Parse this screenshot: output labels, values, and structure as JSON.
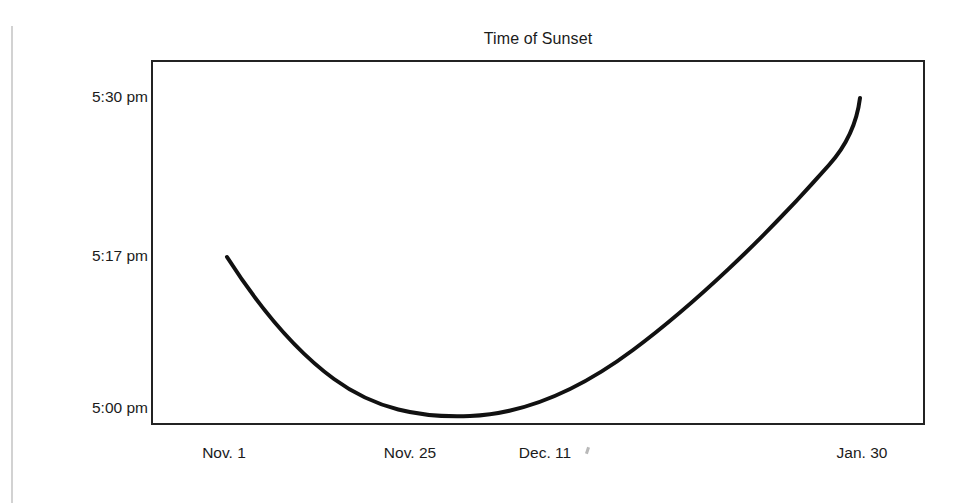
{
  "chart_data": {
    "type": "line",
    "title": "Time of Sunset",
    "xlabel": "",
    "ylabel": "",
    "grid": false,
    "legend": null,
    "x_tick_labels": [
      "Nov. 1",
      "Nov. 25",
      "Dec. 11",
      "Jan. 30"
    ],
    "y_tick_labels": [
      "5:30 pm",
      "5:17 pm",
      "5:00 pm"
    ],
    "ylim": [
      "5:00 pm",
      "5:35 pm"
    ],
    "x_tick_positions_px": [
      224,
      410,
      545,
      862
    ],
    "y_tick_positions_px": [
      97,
      256,
      408
    ],
    "series": [
      {
        "name": "Sunset time",
        "points": [
          {
            "x": "Nov. 1",
            "y": "5:17 pm"
          },
          {
            "x": "Nov. 25",
            "y": "5:03 pm"
          },
          {
            "x": "Dec. 8",
            "y": "5:00 pm"
          },
          {
            "x": "Dec. 11",
            "y": "5:00 pm"
          },
          {
            "x": "Jan. 30",
            "y": "5:30 pm"
          }
        ],
        "curve_px": "M 76,197 C 108,247 142,289 183,319 C 224,349 268,358 319,356 C 370,354 423,334 482,290 C 541,246 612,180 678,105 C 695,86 706,62 709,38",
        "color": "#111111",
        "line_width": 4
      }
    ]
  },
  "axes": {
    "frame_color": "#232323",
    "background": "#ffffff"
  },
  "page": {
    "background": "#ffffff",
    "edge_line_color": "#d2d2d2"
  }
}
